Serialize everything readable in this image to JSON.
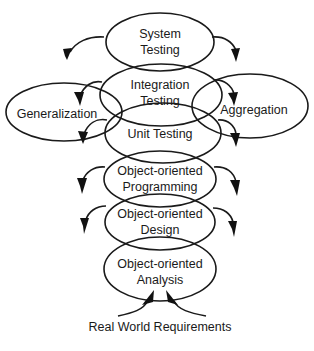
{
  "diagram": {
    "type": "overlapping-ellipse-stack",
    "nodes": [
      {
        "id": "system-testing",
        "lines": [
          "System",
          "Testing"
        ]
      },
      {
        "id": "integration-testing",
        "lines": [
          "Integration",
          "Testing"
        ]
      },
      {
        "id": "unit-testing",
        "lines": [
          "Unit Testing"
        ]
      },
      {
        "id": "generalization",
        "lines": [
          "Generalization"
        ]
      },
      {
        "id": "aggregation",
        "lines": [
          "Aggregation"
        ]
      },
      {
        "id": "oo-programming",
        "lines": [
          "Object-oriented",
          "Programming"
        ]
      },
      {
        "id": "oo-design",
        "lines": [
          "Object-oriented",
          "Design"
        ]
      },
      {
        "id": "oo-analysis",
        "lines": [
          "Object-oriented",
          "Analysis"
        ]
      }
    ],
    "footer": "Real World Requirements",
    "colors": {
      "stroke": "#1a1a1a",
      "background": "#ffffff"
    }
  }
}
